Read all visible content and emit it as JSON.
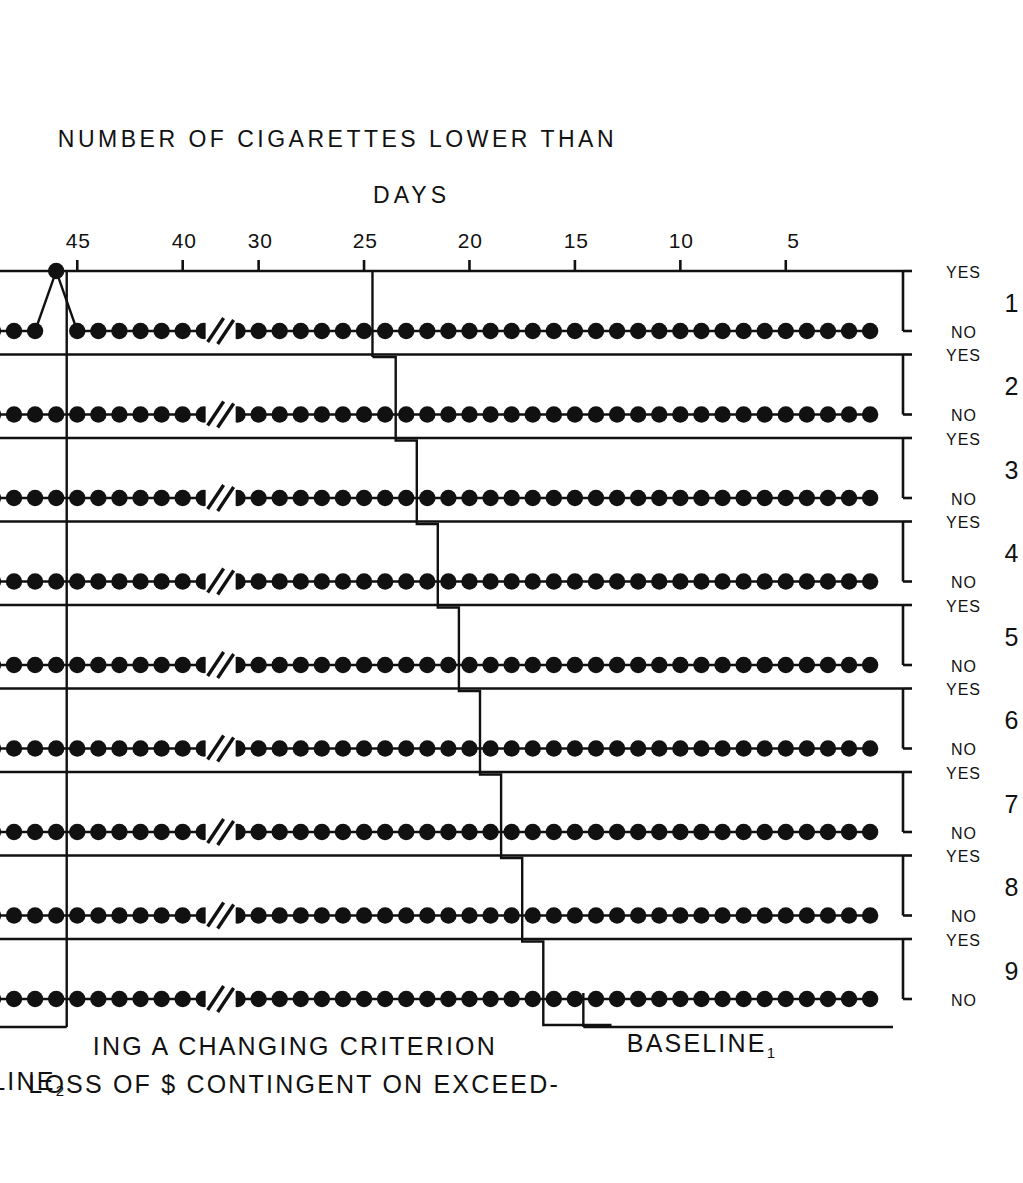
{
  "figure": {
    "axis_titles": {
      "x": "DAYS",
      "y": "NUMBER OF CIGARETTES LOWER THAN"
    },
    "x_ticks": [
      5,
      10,
      15,
      20,
      25,
      30,
      40,
      45,
      50
    ],
    "x_tick_labels": [
      "5",
      "10",
      "15",
      "20",
      "25",
      "30",
      "40",
      "45",
      "50"
    ],
    "axis_break": {
      "between": [
        30,
        40
      ],
      "style": "double-slash"
    },
    "y_categories": [
      "YES",
      "NO"
    ],
    "annotations": [
      {
        "name": "baseline-1",
        "text": "BASELINE",
        "subscript": "1"
      },
      {
        "name": "treatment-phase",
        "line1": "LOSS OF $ CONTINGENT ON EXCEED-",
        "line2": "ING A CHANGING CRITERION"
      },
      {
        "name": "baseline-2",
        "text": "BASELINE",
        "subscript": "2"
      }
    ],
    "phase_lines": [
      {
        "name": "baseline2-phase-line",
        "day": 45.5
      }
    ],
    "criterion_line_name": "changing-criterion-staircase"
  },
  "chart_data": {
    "type": "line",
    "title": "",
    "xlabel": "DAYS",
    "ylabel": "NUMBER OF CIGARETTES LOWER THAN",
    "xlim": [
      0,
      52
    ],
    "ylim_categories": [
      "YES",
      "NO"
    ],
    "grid": false,
    "legend": null,
    "axis_break": {
      "between": [
        30,
        40
      ]
    },
    "note": "Nine stacked panels, one per criterion level (number of cigarettes). Each panel plots a binary daily response: YES = smoked fewer than the stated number, NO = did not. Values are given as YES/NO per day. Baseline-1 length is staggered across panels (multiple-baseline design); the descending staircase is the changing criterion.",
    "panels": [
      {
        "panel": 9,
        "label": "9",
        "baseline1_days": [
          1,
          15
        ],
        "series_start_day": 1,
        "series_end_day": 51,
        "criterion_start_day": 15,
        "values": "NO for every plotted day (days 1-51)",
        "y_values_all": "NO"
      },
      {
        "panel": 8,
        "label": "8",
        "baseline1_days": [
          1,
          17
        ],
        "series_start_day": 1,
        "series_end_day": 51,
        "criterion_start_day": 17,
        "values": "NO for every plotted day (days 1-51)",
        "y_values_all": "NO"
      },
      {
        "panel": 7,
        "label": "7",
        "baseline1_days": [
          1,
          18
        ],
        "series_start_day": 1,
        "series_end_day": 51,
        "criterion_start_day": 18,
        "values": "NO for every plotted day (days 1-51)",
        "y_values_all": "NO"
      },
      {
        "panel": 6,
        "label": "6",
        "baseline1_days": [
          1,
          19
        ],
        "series_start_day": 1,
        "series_end_day": 51,
        "criterion_start_day": 19,
        "values": "NO for every plotted day (days 1-51)",
        "y_values_all": "NO"
      },
      {
        "panel": 5,
        "label": "5",
        "baseline1_days": [
          1,
          20
        ],
        "series_start_day": 1,
        "series_end_day": 51,
        "criterion_start_day": 20,
        "values": "NO for every plotted day (days 1-51)",
        "y_values_all": "NO"
      },
      {
        "panel": 4,
        "label": "4",
        "baseline1_days": [
          1,
          21
        ],
        "series_start_day": 1,
        "series_end_day": 51,
        "criterion_start_day": 21,
        "values": "NO for every plotted day (days 1-51)",
        "y_values_all": "NO"
      },
      {
        "panel": 3,
        "label": "3",
        "baseline1_days": [
          1,
          22
        ],
        "series_start_day": 1,
        "series_end_day": 51,
        "criterion_start_day": 22,
        "values": "NO for every plotted day (days 1-51)",
        "y_values_all": "NO"
      },
      {
        "panel": 2,
        "label": "2",
        "baseline1_days": [
          1,
          23
        ],
        "series_start_day": 1,
        "series_end_day": 51,
        "criterion_start_day": 23,
        "values": "NO for every plotted day (days 1-51)",
        "y_values_all": "NO"
      },
      {
        "panel": 1,
        "label": "1",
        "baseline1_days": [
          1,
          24
        ],
        "series_start_day": 1,
        "series_end_day": 51,
        "criterion_start_day": 24,
        "values": "NO on every day except day 46, which is YES",
        "deviation_days": [
          46
        ],
        "deviation_value": "YES"
      }
    ]
  }
}
